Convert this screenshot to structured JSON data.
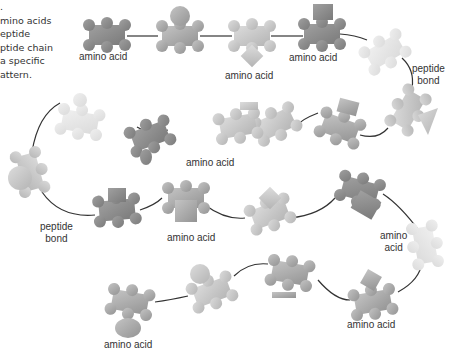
{
  "caption": {
    "lines": [
      ".",
      "mino acids",
      "eptide",
      "ptide chain",
      " a specific",
      "attern."
    ]
  },
  "labels": {
    "aa1": "amino acid",
    "aa2": "amino acid",
    "aa3": "amino acid",
    "pb1_line1": "peptide",
    "pb1_line2": "bond",
    "aa4": "amino acid",
    "pb2_line1": "peptide",
    "pb2_line2": "bond",
    "aa5": "amino acid",
    "aa6_line1": "amino",
    "aa6_line2": "acid",
    "aa7": "amino acid",
    "aa8": "amino acid"
  },
  "colors": {
    "dark": "#8a8a8a",
    "mid": "#a8a8a8",
    "light": "#c8c8c8",
    "faint": "#e2e2e2",
    "bond": "#333333"
  }
}
